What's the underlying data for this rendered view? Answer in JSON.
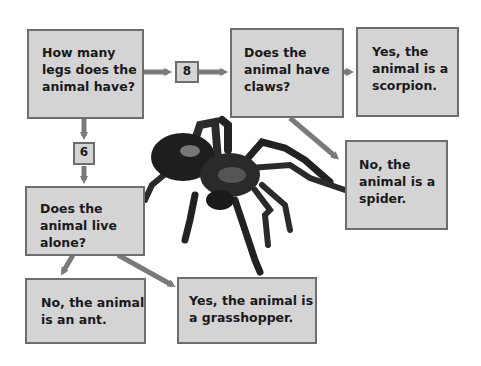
{
  "diagram": {
    "type": "flowchart",
    "nodes": {
      "legs_question": {
        "text": "How many legs does the animal have?"
      },
      "branch_8": {
        "text": "8"
      },
      "branch_6": {
        "text": "6"
      },
      "claws_question": {
        "text": "Does the animal have claws?"
      },
      "scorpion_result": {
        "text": "Yes, the animal is a scorpion."
      },
      "spider_result": {
        "text": "No, the animal is a spider."
      },
      "alone_question": {
        "text": "Does the animal live alone?"
      },
      "ant_result": {
        "text": "No, the animal is an ant."
      },
      "grasshopper_result": {
        "text": "Yes, the animal is a grasshopper."
      }
    },
    "image": {
      "subject": "tarantula spider"
    },
    "colors": {
      "box_fill": "#d4d4d4",
      "box_border": "#6e6e6e",
      "arrow": "#7a7a7a"
    }
  }
}
